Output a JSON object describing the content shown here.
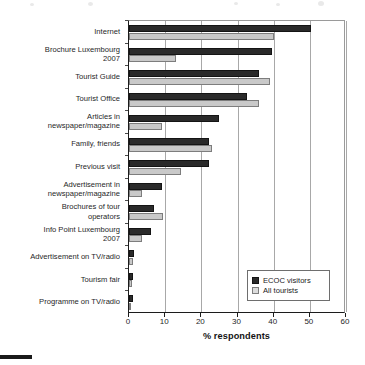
{
  "chart_data": {
    "type": "bar",
    "orientation": "horizontal",
    "title": "",
    "xlabel": "% respondents",
    "ylabel": "",
    "xlim": [
      0,
      60
    ],
    "xticks": [
      0,
      10,
      20,
      30,
      40,
      50,
      60
    ],
    "grid": true,
    "legend_position": "bottom-right",
    "categories": [
      "Internet",
      "Brochure Luxembourg\n2007",
      "Tourist Guide",
      "Tourist Office",
      "Articles in\nnewspaper/magazine",
      "Family, friends",
      "Previous visit",
      "Advertisement in\nnewspaper/magazine",
      "Brochures of tour\noperators",
      "Info Point Luxembourg\n2007",
      "Advertisement on TV/radio",
      "Tourism fair",
      "Programme on TV/radio"
    ],
    "series": [
      {
        "name": "ECOC visitors",
        "color": "#2a2a2a",
        "values": [
          50.3,
          39.5,
          36.0,
          32.5,
          25.0,
          22.0,
          22.0,
          9.0,
          7.0,
          6.0,
          1.5,
          1.2,
          1.0
        ]
      },
      {
        "name": "All tourists",
        "color": "#c9c9c9",
        "values": [
          40.0,
          13.0,
          39.0,
          36.0,
          9.0,
          23.0,
          14.5,
          3.5,
          9.5,
          3.5,
          1.0,
          0.8,
          0.6
        ]
      }
    ]
  },
  "axis": {
    "x_title": "% respondents",
    "tick_labels": [
      "0",
      "10",
      "20",
      "30",
      "40",
      "50",
      "60"
    ]
  },
  "legend": {
    "items": [
      {
        "label": "ECOC visitors",
        "swatch": "dark-swatch"
      },
      {
        "label": "All tourists",
        "swatch": "light-swatch"
      }
    ]
  }
}
